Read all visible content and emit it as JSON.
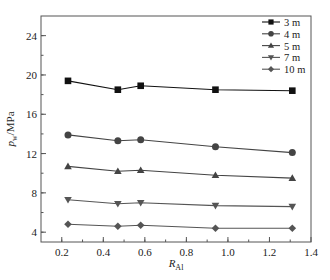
{
  "chart_data": {
    "type": "line",
    "title": "",
    "xlabel": "R_Al",
    "xlabel_main": "R",
    "xlabel_sub": "Al",
    "ylabel": "p_w/MPa",
    "ylabel_main": "p",
    "ylabel_sub": "w",
    "ylabel_unit": "/MPa",
    "xlim": [
      0.1,
      1.4
    ],
    "ylim": [
      3,
      26
    ],
    "xticks": [
      0.2,
      0.4,
      0.6,
      0.8,
      1.0,
      1.2,
      1.4
    ],
    "xtick_labels": [
      "0.2",
      "0.4",
      "0.6",
      "0.8",
      "1.0",
      "1.2",
      "1.4"
    ],
    "yticks": [
      4,
      8,
      12,
      16,
      20,
      24
    ],
    "ytick_labels": [
      "4",
      "8",
      "12",
      "16",
      "20",
      "24"
    ],
    "x_minor_step": 0.1,
    "y_minor_step": 2,
    "grid": false,
    "legend_position": "upper right",
    "x": [
      0.23,
      0.47,
      0.58,
      0.94,
      1.31
    ],
    "series": [
      {
        "name": "3 m",
        "marker": "square",
        "color": "#111111",
        "values": [
          19.4,
          18.5,
          18.9,
          18.5,
          18.4
        ]
      },
      {
        "name": "4 m",
        "marker": "circle",
        "color": "#444444",
        "values": [
          13.9,
          13.3,
          13.4,
          12.7,
          12.1
        ]
      },
      {
        "name": "5 m",
        "marker": "triangle-up",
        "color": "#444444",
        "values": [
          10.7,
          10.2,
          10.3,
          9.8,
          9.5
        ]
      },
      {
        "name": "7 m",
        "marker": "triangle-down",
        "color": "#555555",
        "values": [
          7.3,
          6.9,
          7.0,
          6.7,
          6.6
        ]
      },
      {
        "name": "10 m",
        "marker": "diamond",
        "color": "#555555",
        "values": [
          4.8,
          4.6,
          4.7,
          4.4,
          4.4
        ]
      }
    ]
  }
}
